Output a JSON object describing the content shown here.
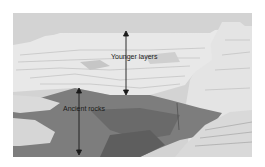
{
  "figure": {
    "colors": {
      "sky": "#d2d2d2",
      "younger_layers": "#e6e6e6",
      "younger_shadow": "#bdbdbd",
      "ancient_rocks": "#7a7a7a",
      "ancient_dark": "#5e5e5e",
      "arrow": "#1a1a1a"
    },
    "labels": {
      "younger": "Younger layers",
      "ancient": "Ancient rocks"
    },
    "arrows": [
      {
        "name": "younger-layers-arrow",
        "x": 126,
        "y1": 31,
        "y2": 95
      },
      {
        "name": "ancient-rocks-arrow",
        "x": 79,
        "y1": 88,
        "y2": 155
      }
    ]
  }
}
